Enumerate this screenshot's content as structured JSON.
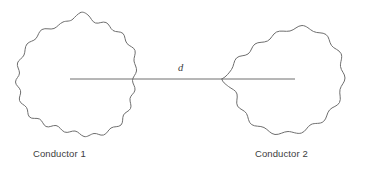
{
  "figure": {
    "type": "physics-diagram",
    "title_visible": false,
    "background_color": "#ffffff",
    "stroke_color": "#6e6e6e",
    "text_color": "#3c3c3c",
    "distance_label": "d",
    "labels": {
      "left_conductor": "Conductor 1",
      "right_conductor": "Conductor 2"
    },
    "elements": {
      "left_blob_name": "conductor-1-shape",
      "right_blob_name": "conductor-2-shape",
      "connector_name": "separation-distance-line"
    },
    "geometry": {
      "line_y": 79,
      "line_x_start": 70,
      "line_x_end": 295,
      "left_blob_center_x": 78,
      "left_blob_center_y": 78,
      "right_blob_center_x": 285,
      "right_blob_center_y": 78
    }
  }
}
